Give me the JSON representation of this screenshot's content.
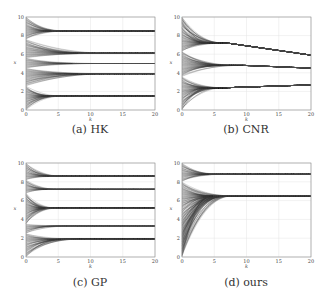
{
  "figure": {
    "panels": [
      {
        "id": "a",
        "caption": "(a) HK",
        "frame": {
          "x0": 26,
          "y0": 17,
          "x1": 155,
          "y1": 110
        },
        "caption_pos": {
          "x": 20,
          "y": 123
        }
      },
      {
        "id": "b",
        "caption": "(b) CNR",
        "frame": {
          "x0": 182,
          "y0": 17,
          "x1": 311,
          "y1": 110
        },
        "caption_pos": {
          "x": 176,
          "y": 123
        }
      },
      {
        "id": "c",
        "caption": "(c) GP",
        "frame": {
          "x0": 26,
          "y0": 163,
          "x1": 155,
          "y1": 257
        },
        "caption_pos": {
          "x": 20,
          "y": 276
        }
      },
      {
        "id": "d",
        "caption": "(d) ours",
        "frame": {
          "x0": 182,
          "y0": 163,
          "x1": 311,
          "y1": 257
        },
        "caption_pos": {
          "x": 176,
          "y": 276
        }
      }
    ]
  },
  "chart_data": [
    {
      "type": "line",
      "title": "(a) HK",
      "xlabel": "k",
      "ylabel": "x",
      "xlim": [
        0,
        20
      ],
      "ylim": [
        0,
        10
      ],
      "xticks": [
        0,
        5,
        10,
        15,
        20
      ],
      "yticks": [
        0,
        2,
        4,
        6,
        8,
        10
      ],
      "grid": true,
      "n_agents": 200,
      "clusters": [
        {
          "final_value": 8.5,
          "converge_k": 6.5,
          "init_range": [
            7.6,
            10.0
          ]
        },
        {
          "final_value": 6.1,
          "converge_k": 13.5,
          "init_range": [
            5.6,
            7.6
          ]
        },
        {
          "final_value": 5.0,
          "converge_k": 12.0,
          "init_range": [
            4.5,
            5.6
          ]
        },
        {
          "final_value": 3.9,
          "converge_k": 13.5,
          "init_range": [
            2.6,
            4.5
          ]
        },
        {
          "final_value": 1.5,
          "converge_k": 6.0,
          "init_range": [
            0.0,
            2.6
          ]
        }
      ]
    },
    {
      "type": "line",
      "title": "(b) CNR",
      "xlabel": "k",
      "ylabel": "x",
      "xlim": [
        0,
        20
      ],
      "ylim": [
        0,
        10
      ],
      "xticks": [
        0,
        5,
        10,
        15,
        20
      ],
      "yticks": [
        0,
        2,
        4,
        6,
        8,
        10
      ],
      "grid": true,
      "n_agents": 200,
      "clusters": [
        {
          "merge_value": 7.2,
          "converge_k": 7.0,
          "final_value": 5.9,
          "init_range": [
            6.3,
            10.0
          ]
        },
        {
          "merge_value": 4.8,
          "converge_k": 9.5,
          "final_value": 4.5,
          "init_range": [
            3.6,
            6.3
          ]
        },
        {
          "merge_value": 2.4,
          "converge_k": 7.0,
          "final_value": 2.7,
          "init_range": [
            0.0,
            3.6
          ]
        }
      ]
    },
    {
      "type": "line",
      "title": "(c) GP",
      "xlabel": "k",
      "ylabel": "x",
      "xlim": [
        0,
        20
      ],
      "ylim": [
        0,
        10
      ],
      "xticks": [
        0,
        5,
        10,
        15,
        20
      ],
      "yticks": [
        0,
        2,
        4,
        6,
        8,
        10
      ],
      "grid": true,
      "n_agents": 200,
      "clusters": [
        {
          "final_value": 8.6,
          "converge_k": 6.0,
          "init_range": [
            8.2,
            10.0
          ]
        },
        {
          "final_value": 7.2,
          "converge_k": 5.5,
          "init_range": [
            6.8,
            8.2
          ]
        },
        {
          "final_value": 5.2,
          "converge_k": 5.0,
          "init_range": [
            3.5,
            6.8
          ]
        },
        {
          "final_value": 3.3,
          "converge_k": 7.5,
          "init_range": [
            2.5,
            3.5
          ]
        },
        {
          "final_value": 1.9,
          "converge_k": 9.0,
          "init_range": [
            0.0,
            2.5
          ]
        }
      ]
    },
    {
      "type": "line",
      "title": "(d) ours",
      "xlabel": "k",
      "ylabel": "x",
      "xlim": [
        0,
        20
      ],
      "ylim": [
        0,
        10
      ],
      "xticks": [
        0,
        5,
        10,
        15,
        20
      ],
      "yticks": [
        0,
        2,
        4,
        6,
        8,
        10
      ],
      "grid": true,
      "n_agents": 200,
      "clusters": [
        {
          "final_value": 8.8,
          "converge_k": 7.0,
          "init_range": [
            8.0,
            10.0
          ]
        },
        {
          "final_value": 6.5,
          "converge_k": 8.0,
          "init_range": [
            0.0,
            8.0
          ]
        }
      ]
    }
  ]
}
